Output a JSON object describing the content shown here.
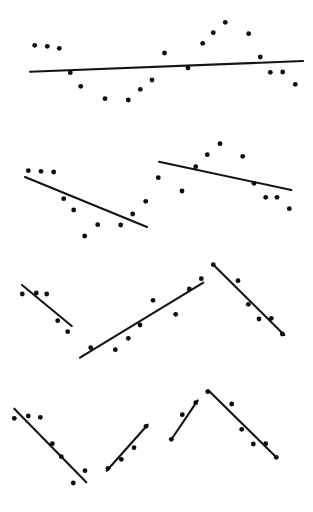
{
  "figure": {
    "title": "",
    "background_color": "#ffffff",
    "width": 313,
    "height": 512,
    "point_color": "#0c0c0c",
    "line_color": "#141414",
    "point_radius": 2.4,
    "line_width": 2.1
  },
  "chart_data": {
    "type": "scatter",
    "title": "",
    "subtitle": "",
    "xlabel": "",
    "ylabel": "",
    "grid": false,
    "legend": "none",
    "axes_visible": false,
    "tick_labels": [],
    "annotations": [],
    "xlim": [
      0,
      313
    ],
    "ylim": [
      0,
      512
    ],
    "note": "Four stacked panels of scatter points, each overlaid with one or two straight fitted trend segments. Coordinates are in image pixel space with y increasing downward.",
    "panels": [
      {
        "id": "panel-1",
        "row": 1,
        "label": "flat-slightly-rising",
        "points": [
          {
            "x": 34.7,
            "y": 45.3
          },
          {
            "x": 47.3,
            "y": 46.3
          },
          {
            "x": 59.3,
            "y": 48.3
          },
          {
            "x": 70.3,
            "y": 72.7
          },
          {
            "x": 80.7,
            "y": 86.3
          },
          {
            "x": 105.0,
            "y": 98.7
          },
          {
            "x": 128.3,
            "y": 100.0
          },
          {
            "x": 140.3,
            "y": 89.3
          },
          {
            "x": 152.0,
            "y": 80.0
          },
          {
            "x": 164.5,
            "y": 53.0
          },
          {
            "x": 188.0,
            "y": 68.0
          },
          {
            "x": 202.7,
            "y": 43.3
          },
          {
            "x": 213.3,
            "y": 32.7
          },
          {
            "x": 225.3,
            "y": 22.3
          },
          {
            "x": 248.7,
            "y": 33.7
          },
          {
            "x": 260.3,
            "y": 57.0
          },
          {
            "x": 270.3,
            "y": 72.3
          },
          {
            "x": 282.7,
            "y": 72.0
          },
          {
            "x": 295.3,
            "y": 84.3
          }
        ],
        "lines": [
          {
            "x1": 30.0,
            "y1": 71.8,
            "x2": 303.0,
            "y2": 61.0,
            "slope": -0.0396
          }
        ]
      },
      {
        "id": "panel-2",
        "row": 2,
        "label": "two-descending-segments",
        "points": [
          {
            "x": 28.3,
            "y": 170.7
          },
          {
            "x": 41.0,
            "y": 171.3
          },
          {
            "x": 53.7,
            "y": 172.0
          },
          {
            "x": 63.7,
            "y": 198.7
          },
          {
            "x": 73.7,
            "y": 210.0
          },
          {
            "x": 84.7,
            "y": 236.0
          },
          {
            "x": 97.7,
            "y": 224.7
          },
          {
            "x": 120.7,
            "y": 225.0
          },
          {
            "x": 132.7,
            "y": 214.0
          },
          {
            "x": 145.7,
            "y": 201.3
          },
          {
            "x": 158.3,
            "y": 177.7
          },
          {
            "x": 182.0,
            "y": 191.0
          },
          {
            "x": 195.7,
            "y": 166.7
          },
          {
            "x": 207.3,
            "y": 154.7
          },
          {
            "x": 220.0,
            "y": 143.7
          },
          {
            "x": 242.7,
            "y": 156.3
          },
          {
            "x": 254.0,
            "y": 183.3
          },
          {
            "x": 265.7,
            "y": 197.3
          },
          {
            "x": 277.0,
            "y": 197.3
          },
          {
            "x": 289.3,
            "y": 208.7
          }
        ],
        "lines": [
          {
            "x1": 25.0,
            "y1": 177.0,
            "x2": 147.0,
            "y2": 227.0,
            "slope": 0.4098
          },
          {
            "x1": 159.0,
            "y1": 161.7,
            "x2": 291.3,
            "y2": 190.0,
            "slope": 0.214
          }
        ]
      },
      {
        "id": "panel-3",
        "row": 3,
        "label": "down-up-down-zigzag",
        "points": [
          {
            "x": 22.3,
            "y": 294.0
          },
          {
            "x": 36.3,
            "y": 293.0
          },
          {
            "x": 46.7,
            "y": 294.0
          },
          {
            "x": 57.7,
            "y": 320.7
          },
          {
            "x": 67.7,
            "y": 331.7
          },
          {
            "x": 90.7,
            "y": 347.7
          },
          {
            "x": 115.3,
            "y": 349.7
          },
          {
            "x": 128.3,
            "y": 338.3
          },
          {
            "x": 140.0,
            "y": 325.0
          },
          {
            "x": 153.0,
            "y": 300.3
          },
          {
            "x": 175.7,
            "y": 314.3
          },
          {
            "x": 189.3,
            "y": 289.0
          },
          {
            "x": 201.3,
            "y": 278.7
          },
          {
            "x": 213.3,
            "y": 264.7
          },
          {
            "x": 238.0,
            "y": 280.7
          },
          {
            "x": 248.3,
            "y": 304.3
          },
          {
            "x": 259.0,
            "y": 319.0
          },
          {
            "x": 271.3,
            "y": 318.3
          },
          {
            "x": 282.3,
            "y": 334.0
          }
        ],
        "lines": [
          {
            "x1": 22.0,
            "y1": 285.0,
            "x2": 71.7,
            "y2": 326.0,
            "slope": 0.8249
          },
          {
            "x1": 80.0,
            "y1": 357.7,
            "x2": 203.3,
            "y2": 282.7,
            "slope": -0.6082
          },
          {
            "x1": 213.3,
            "y1": 264.7,
            "x2": 284.3,
            "y2": 335.0,
            "slope": 0.9901
          }
        ]
      },
      {
        "id": "panel-4",
        "row": 4,
        "label": "descending-ascending-peak",
        "points": [
          {
            "x": 14.3,
            "y": 418.3
          },
          {
            "x": 28.3,
            "y": 416.0
          },
          {
            "x": 40.3,
            "y": 417.3
          },
          {
            "x": 52.3,
            "y": 443.7
          },
          {
            "x": 61.3,
            "y": 456.7
          },
          {
            "x": 73.3,
            "y": 483.0
          },
          {
            "x": 85.0,
            "y": 470.7
          },
          {
            "x": 108.0,
            "y": 468.3
          },
          {
            "x": 121.3,
            "y": 459.3
          },
          {
            "x": 134.0,
            "y": 447.7
          },
          {
            "x": 146.0,
            "y": 426.3
          },
          {
            "x": 171.3,
            "y": 439.3
          },
          {
            "x": 182.3,
            "y": 414.7
          },
          {
            "x": 195.7,
            "y": 402.7
          },
          {
            "x": 207.7,
            "y": 391.7
          },
          {
            "x": 231.7,
            "y": 404.0
          },
          {
            "x": 241.7,
            "y": 429.3
          },
          {
            "x": 253.3,
            "y": 444.0
          },
          {
            "x": 265.7,
            "y": 443.7
          },
          {
            "x": 276.3,
            "y": 457.3
          }
        ],
        "lines": [
          {
            "x1": 14.3,
            "y1": 408.7,
            "x2": 86.3,
            "y2": 482.3,
            "slope": 1.0222
          },
          {
            "x1": 106.7,
            "y1": 470.7,
            "x2": 147.7,
            "y2": 424.7,
            "slope": -1.122
          },
          {
            "x1": 171.0,
            "y1": 440.0,
            "x2": 197.7,
            "y2": 400.3,
            "slope": -1.4869
          },
          {
            "x1": 208.3,
            "y1": 390.3,
            "x2": 277.0,
            "y2": 458.0,
            "slope": 0.9854
          }
        ]
      }
    ]
  }
}
